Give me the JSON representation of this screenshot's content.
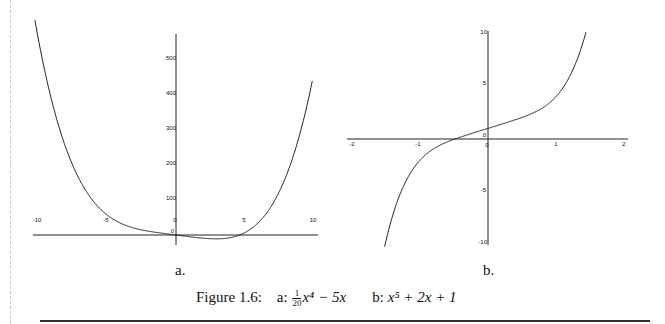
{
  "figure": {
    "label": "Figure 1.6:",
    "caption_a_prefix": "a:",
    "caption_a_frac_num": "1",
    "caption_a_frac_den": "20",
    "caption_a_rest": "x⁴ − 5x",
    "caption_b_prefix": "b:",
    "caption_b_expr": "x⁵ + 2x + 1",
    "sub_a": "a.",
    "sub_b": "b."
  },
  "chart_data": [
    {
      "type": "line",
      "title": "a.",
      "function": "(1/20)x^4 - 5x",
      "xlabel": "",
      "ylabel": "",
      "xlim": [
        -10.5,
        10.5
      ],
      "ylim": [
        -30,
        560
      ],
      "x_ticks": [
        -10,
        -5,
        0,
        5,
        10
      ],
      "y_ticks": [
        0,
        100,
        200,
        300,
        400,
        500
      ],
      "grid": false,
      "series": [
        {
          "name": "f(x)",
          "x": [
            -10,
            -8,
            -6,
            -4,
            -2,
            0,
            2,
            4,
            5,
            6,
            8,
            10
          ],
          "y": [
            550,
            244.8,
            94.8,
            32.8,
            10.8,
            0,
            -9.2,
            -7.2,
            6.25,
            34.8,
            164.8,
            450
          ]
        }
      ]
    },
    {
      "type": "line",
      "title": "b.",
      "function": "x^5 + 2x + 1",
      "xlabel": "",
      "ylabel": "",
      "xlim": [
        -2,
        2
      ],
      "ylim": [
        -10,
        10
      ],
      "x_ticks": [
        -2,
        -1,
        0,
        1,
        2
      ],
      "y_ticks": [
        -10,
        -5,
        0,
        5,
        10
      ],
      "grid": false,
      "series": [
        {
          "name": "g(x)",
          "x": [
            -1.55,
            -1.25,
            -1,
            -0.5,
            0,
            0.5,
            1,
            1.25,
            1.48
          ],
          "y": [
            -10.0,
            -4.55,
            -2,
            -0.03,
            1,
            2.03,
            4,
            6.55,
            10.0
          ]
        }
      ]
    }
  ]
}
